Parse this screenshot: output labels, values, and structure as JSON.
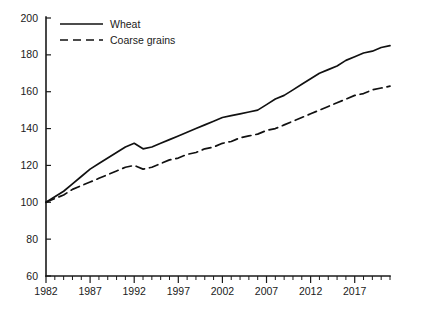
{
  "chart_data": {
    "type": "line",
    "title": "",
    "subtitle": "",
    "xlabel": "",
    "ylabel": "",
    "xlim": [
      1982,
      2021
    ],
    "ylim": [
      60,
      200
    ],
    "grid": false,
    "legend_position": "top-left inside plot",
    "y_ticks": [
      60,
      80,
      100,
      120,
      140,
      160,
      180,
      200
    ],
    "x_ticks": [
      1982,
      1987,
      1992,
      1997,
      2002,
      2007,
      2012,
      2017
    ],
    "x_minor_tick_interval": 1,
    "x": [
      1982,
      1983,
      1984,
      1985,
      1986,
      1987,
      1988,
      1989,
      1990,
      1991,
      1992,
      1993,
      1994,
      1995,
      1996,
      1997,
      1998,
      1999,
      2000,
      2001,
      2002,
      2003,
      2004,
      2005,
      2006,
      2007,
      2008,
      2009,
      2010,
      2011,
      2012,
      2013,
      2014,
      2015,
      2016,
      2017,
      2018,
      2019,
      2020,
      2021
    ],
    "series": [
      {
        "name": "Wheat",
        "style": "solid",
        "color": "#111111",
        "values": [
          100,
          103,
          106,
          110,
          114,
          118,
          121,
          124,
          127,
          130,
          132,
          129,
          130,
          132,
          134,
          136,
          138,
          140,
          142,
          144,
          146,
          147,
          148,
          149,
          150,
          153,
          156,
          158,
          161,
          164,
          167,
          170,
          172,
          174,
          177,
          179,
          181,
          182,
          184,
          185
        ]
      },
      {
        "name": "Coarse grains",
        "style": "dashed",
        "color": "#111111",
        "values": [
          100,
          102,
          104,
          107,
          109,
          111,
          113,
          115,
          117,
          119,
          120,
          118,
          119,
          121,
          123,
          124,
          126,
          127,
          129,
          130,
          132,
          133,
          135,
          136,
          137,
          139,
          140,
          142,
          144,
          146,
          148,
          150,
          152,
          154,
          156,
          158,
          159,
          161,
          162,
          163
        ]
      }
    ],
    "legend": [
      {
        "label": "Wheat",
        "style": "solid"
      },
      {
        "label": "Coarse grains",
        "style": "dashed"
      }
    ]
  },
  "layout": {
    "plot": {
      "left": 46,
      "right": 390,
      "top": 18,
      "bottom": 276
    }
  }
}
